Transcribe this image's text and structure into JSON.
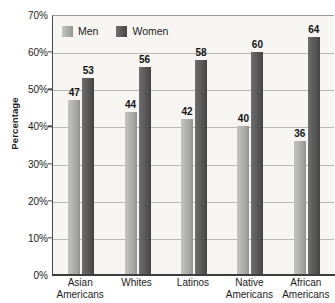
{
  "chart_data": {
    "type": "bar",
    "title": "",
    "xlabel": "",
    "ylabel": "Percentage",
    "ylim": [
      0,
      70
    ],
    "ytick_values": [
      0,
      10,
      20,
      30,
      40,
      50,
      60,
      70
    ],
    "ytick_labels": [
      "0%",
      "10%",
      "20%",
      "30%",
      "40%",
      "50%",
      "60%",
      "70%"
    ],
    "grid": true,
    "legend_position": "upper-left-inside",
    "categories": [
      "Asian Americans",
      "Whites",
      "Latinos",
      "Native Americans",
      "African Americans"
    ],
    "category_lines": [
      {
        "line1": "Asian",
        "line2": "Americans"
      },
      {
        "line1": "Whites",
        "line2": ""
      },
      {
        "line1": "Latinos",
        "line2": ""
      },
      {
        "line1": "Native",
        "line2": "Americans"
      },
      {
        "line1": "African",
        "line2": "Americans"
      }
    ],
    "series": [
      {
        "name": "Men",
        "color": "#aaaaa8",
        "values": [
          47,
          44,
          42,
          40,
          36
        ]
      },
      {
        "name": "Women",
        "color": "#565656",
        "values": [
          53,
          56,
          58,
          60,
          64
        ]
      }
    ],
    "data_labels": [
      {
        "category": "Asian Americans",
        "Men": "47",
        "Women": "53"
      },
      {
        "category": "Whites",
        "Men": "44",
        "Women": "56"
      },
      {
        "category": "Latinos",
        "Men": "42",
        "Women": "58"
      },
      {
        "category": "Native Americans",
        "Men": "40",
        "Women": "60"
      },
      {
        "category": "African Americans",
        "Men": "36",
        "Women": "64"
      }
    ]
  },
  "legend": {
    "items": [
      {
        "label": "Men"
      },
      {
        "label": "Women"
      }
    ]
  },
  "colors": {
    "plot_background": "#f6f5f2",
    "gridline": "#b9b9b5",
    "axis": "#3d3d3d",
    "text": "#1c1c1c",
    "men_bar": "#aaaaa8",
    "women_bar": "#565656"
  }
}
